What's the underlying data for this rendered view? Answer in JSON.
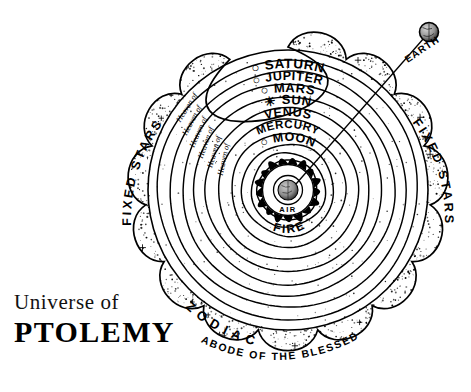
{
  "title": {
    "line1": "Universe of",
    "line2": "PTOLEMY"
  },
  "callout": {
    "label": "EARTH",
    "icon": "earth-globe-icon"
  },
  "outer_band": {
    "left_label": "FIXED STARS",
    "right_label": "FIXED STARS",
    "bottom_left_label": "Z O D I A C",
    "bottom_label": "ABODE OF THE BLESSED"
  },
  "center": {
    "fire_label": "FIRE",
    "air_label": "AIR",
    "core_icon": "earth-core-globe-icon"
  },
  "spheres": [
    {
      "prefix": "Heaven of",
      "symbol": "○",
      "name": "SATURN"
    },
    {
      "prefix": "Heaven of",
      "symbol": "○",
      "name": "JUPITER"
    },
    {
      "prefix": "Heaven of",
      "symbol": "○",
      "name": "MARS"
    },
    {
      "prefix": "Heaven of",
      "symbol": "☀",
      "name": "SUN"
    },
    {
      "prefix": "Heaven of",
      "symbol": "",
      "name": "VENUS"
    },
    {
      "prefix": "Heaven of",
      "symbol": "",
      "name": "MERCURY"
    },
    {
      "prefix": "",
      "symbol": "○",
      "name": "MOON"
    }
  ],
  "chart_data": {
    "type": "diagram",
    "title": "Universe of PTOLEMY",
    "center_body": "Earth",
    "elements_rings": [
      "AIR",
      "FIRE"
    ],
    "sphere_order_inward_to_outward": [
      "MOON",
      "MERCURY",
      "VENUS",
      "SUN",
      "MARS",
      "JUPITER",
      "SATURN"
    ],
    "outermost_band": "FIXED STARS",
    "bands": [
      "ZODIAC",
      "ABODE OF THE BLESSED"
    ],
    "ring_count": 12,
    "center_xy": [
      288,
      190
    ],
    "outer_radius": 170
  },
  "colors": {
    "ink": "#000000",
    "paper": "#ffffff"
  }
}
